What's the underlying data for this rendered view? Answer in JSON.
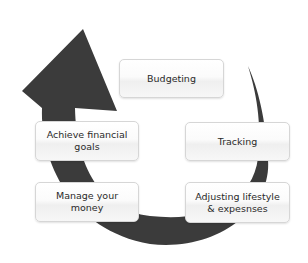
{
  "diagram": {
    "type": "cycle",
    "colors": {
      "arrow": "#3b3b3b",
      "box_border": "#d6d6d6",
      "box_text": "#2a2a2a",
      "background": "#ffffff"
    },
    "steps": [
      {
        "id": "budgeting",
        "label": "Budgeting"
      },
      {
        "id": "tracking",
        "label": "Tracking"
      },
      {
        "id": "adjusting",
        "label": "Adjusting lifestyle\n& expesnses"
      },
      {
        "id": "manage",
        "label": "Manage your\nmoney"
      },
      {
        "id": "achieve",
        "label": "Achieve financial\ngoals"
      }
    ],
    "arrow_icon": "circular-arrow-icon"
  }
}
